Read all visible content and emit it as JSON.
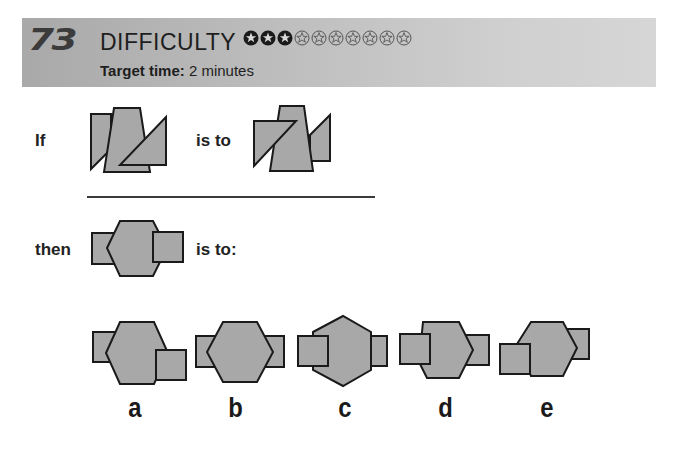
{
  "header": {
    "question_number": "73",
    "difficulty_label": "DIFFICULTY",
    "difficulty_rating": 3,
    "difficulty_max": 10,
    "target_time_label": "Target time:",
    "target_time_value": "2 minutes"
  },
  "puzzle": {
    "if_label": "If",
    "is_to_label": "is to",
    "then_label": "then",
    "is_to_colon_label": "is to:",
    "shape_fill": "#a8a8a8",
    "shape_stroke": "#1a1a1a"
  },
  "options": [
    {
      "label": "a"
    },
    {
      "label": "b"
    },
    {
      "label": "c"
    },
    {
      "label": "d"
    },
    {
      "label": "e"
    }
  ]
}
